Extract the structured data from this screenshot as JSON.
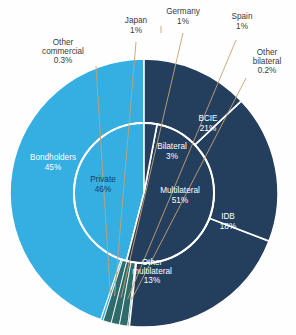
{
  "chart_data": {
    "type": "pie",
    "title": "",
    "subtitle": "",
    "xlabel": "",
    "ylabel": "",
    "legend_position": "none",
    "grid": false,
    "layout": "two-ring nested pie (inner ring = creditor class, outer ring = individual creditors)",
    "center": {
      "x": 144,
      "y": 193
    },
    "outer_radius": 134,
    "inner_radius": 70,
    "start_angle_deg": -90,
    "direction": "counterclockwise",
    "colors": {
      "private": "#35aee2",
      "multilateral": "#243f5e",
      "bilateral": "#2e6b6b",
      "separator": "#ffffff",
      "leader_line": "#c8a070",
      "background": "#fefefe",
      "label_on_dark": "#ffffff",
      "label_on_light": "#16405e",
      "callout_text": "#3a3a3a"
    },
    "inner_ring": {
      "name": "Creditor class",
      "categories": [
        "Private",
        "Multilateral",
        "Bilateral"
      ],
      "values": [
        46,
        51,
        3
      ],
      "slices": [
        {
          "label": "Private",
          "value": 46,
          "value_text": "46%",
          "color": "#35aee2",
          "label_x": 103,
          "label_y": 185,
          "label_fill": "on-light"
        },
        {
          "label": "Multilateral",
          "value": 51,
          "value_text": "51%",
          "color": "#243f5e",
          "label_x": 180,
          "label_y": 196,
          "label_fill": "on-dark"
        },
        {
          "label": "Bilateral",
          "value": 3,
          "value_text": "3%",
          "color": "#243f5e",
          "label_x": 172,
          "label_y": 152,
          "label_fill": "on-dark"
        }
      ]
    },
    "outer_ring": {
      "name": "Individual creditors",
      "categories": [
        "Bondholders",
        "Other commercial",
        "Japan",
        "Germany",
        "Spain",
        "Other bilateral",
        "BCIE",
        "IDB",
        "Other multilateral"
      ],
      "values": [
        45,
        0.3,
        1,
        1,
        1,
        0.2,
        21,
        18,
        13
      ],
      "slices": [
        {
          "label": "Bondholders",
          "value": 45,
          "value_text": "45%",
          "color": "#35aee2",
          "placement": "inside",
          "label_x": 53,
          "label_y": 163
        },
        {
          "label": "Other commercial",
          "value": 0.3,
          "value_text": "0.3%",
          "color": "#35aee2",
          "placement": "callout",
          "label_x": 63,
          "label_y": 52
        },
        {
          "label": "Japan",
          "value": 1,
          "value_text": "1%",
          "color": "#2e6b6b",
          "placement": "callout",
          "label_x": 136,
          "label_y": 26
        },
        {
          "label": "Germany",
          "value": 1,
          "value_text": "1%",
          "color": "#2e6b6b",
          "placement": "callout",
          "label_x": 183,
          "label_y": 17
        },
        {
          "label": "Spain",
          "value": 1,
          "value_text": "1%",
          "color": "#2e6b6b",
          "placement": "callout",
          "label_x": 242,
          "label_y": 22
        },
        {
          "label": "Other bilateral",
          "value": 0.2,
          "value_text": "0.2%",
          "color": "#2e6b6b",
          "placement": "callout",
          "label_x": 267,
          "label_y": 62
        },
        {
          "label": "BCIE",
          "value": 21,
          "value_text": "21%",
          "color": "#243f5e",
          "placement": "inside",
          "label_x": 208,
          "label_y": 124
        },
        {
          "label": "IDB",
          "value": 18,
          "value_text": "18%",
          "color": "#243f5e",
          "placement": "inside",
          "label_x": 228,
          "label_y": 222
        },
        {
          "label": "Other multilateral",
          "value": 13,
          "value_text": "13%",
          "color": "#243f5e",
          "placement": "inside",
          "label_x": 152,
          "label_y": 272
        }
      ]
    }
  }
}
